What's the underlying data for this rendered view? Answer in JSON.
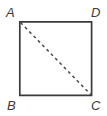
{
  "figure": {
    "kind": "geometry-diagram",
    "shape": "square",
    "background_color": "#ffffff",
    "stroke_color": "#3b3b3b",
    "label_color": "#3b3b3b",
    "square": {
      "left": 19,
      "top": 21,
      "right": 92,
      "bottom": 96,
      "stroke_width": 1.6
    },
    "diagonal": {
      "from": "A",
      "to": "C",
      "x1": 20,
      "y1": 22,
      "x2": 91,
      "y2": 95,
      "style": "dashed",
      "dash": "3 3",
      "stroke_width": 1.4
    },
    "vertices": [
      {
        "id": "A",
        "label": "A",
        "position": "top-left"
      },
      {
        "id": "D",
        "label": "D",
        "position": "top-right"
      },
      {
        "id": "B",
        "label": "B",
        "position": "bottom-left"
      },
      {
        "id": "C",
        "label": "C",
        "position": "bottom-right"
      }
    ]
  }
}
